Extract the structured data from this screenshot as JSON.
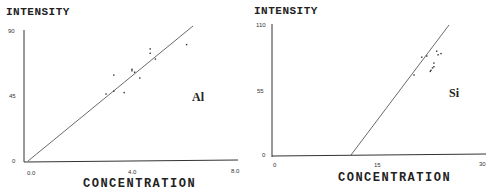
{
  "chart_data": [
    {
      "type": "scatter",
      "title": "",
      "element_label": "Al",
      "xlabel": "CONCENTRATION",
      "ylabel": "INTENSITY",
      "xlim": [
        0.0,
        8.0
      ],
      "ylim": [
        0,
        90
      ],
      "x_ticks": [
        "0.0",
        "4.0",
        "8.0"
      ],
      "y_ticks": [
        "0",
        "45",
        "90"
      ],
      "grid": false,
      "points": [
        {
          "x": 3.0,
          "y": 46
        },
        {
          "x": 3.3,
          "y": 48
        },
        {
          "x": 3.3,
          "y": 59
        },
        {
          "x": 3.7,
          "y": 47
        },
        {
          "x": 4.0,
          "y": 62
        },
        {
          "x": 4.0,
          "y": 63
        },
        {
          "x": 4.3,
          "y": 57
        },
        {
          "x": 4.7,
          "y": 74
        },
        {
          "x": 4.7,
          "y": 77
        },
        {
          "x": 4.9,
          "y": 70
        },
        {
          "x": 6.1,
          "y": 80
        },
        {
          "x": 4.1,
          "y": 61
        }
      ],
      "fit_line": {
        "x": [
          0.0,
          6.4
        ],
        "y": [
          0,
          91
        ]
      }
    },
    {
      "type": "scatter",
      "title": "",
      "element_label": "Si",
      "xlabel": "CONCENTRATION",
      "ylabel": "INTENSITY",
      "xlim": [
        0,
        30
      ],
      "ylim": [
        0,
        110
      ],
      "x_ticks": [
        "0",
        "15",
        "30"
      ],
      "y_ticks": [
        "0",
        "55",
        "110"
      ],
      "grid": false,
      "points": [
        {
          "x": 20.0,
          "y": 68
        },
        {
          "x": 21.1,
          "y": 83
        },
        {
          "x": 21.8,
          "y": 84
        },
        {
          "x": 22.4,
          "y": 72
        },
        {
          "x": 22.6,
          "y": 74
        },
        {
          "x": 22.8,
          "y": 75
        },
        {
          "x": 22.8,
          "y": 78
        },
        {
          "x": 23.2,
          "y": 88
        },
        {
          "x": 23.4,
          "y": 85
        },
        {
          "x": 23.8,
          "y": 86
        },
        {
          "x": 22.3,
          "y": 71
        }
      ],
      "fit_line": {
        "x": [
          11.0,
          24.8
        ],
        "y": [
          0,
          110
        ]
      }
    }
  ],
  "panels": [
    {
      "ylabel": "INTENSITY",
      "xlabel": "CONCENTRATION",
      "element": "Al",
      "y_top": "90",
      "y_mid": "45",
      "y_bot": "0",
      "x_left": "0.0",
      "x_mid": "4.0",
      "x_right": "8.0"
    },
    {
      "ylabel": "INTENSITY",
      "xlabel": "CONCENTRATION",
      "element": "Si",
      "y_top": "110",
      "y_mid": "55",
      "y_bot": "0",
      "x_left": "0",
      "x_mid": "15",
      "x_right": "30"
    }
  ]
}
